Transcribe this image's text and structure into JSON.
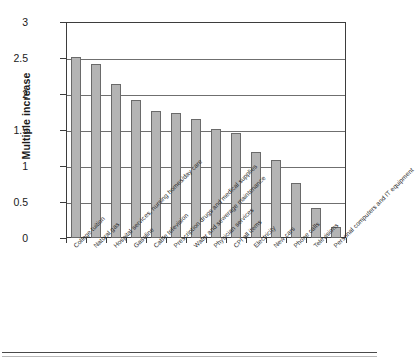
{
  "chart_data": {
    "type": "bar",
    "title": "",
    "subtitle": "",
    "xlabel": "",
    "ylabel": "Multiple increase",
    "ylim": [
      0,
      3
    ],
    "ytick_values": [
      0,
      0.5,
      1,
      1.5,
      2,
      2.5,
      3
    ],
    "ytick_labels": [
      "0",
      "0.5",
      "1",
      "1.5",
      "2",
      "2.5",
      "3"
    ],
    "grid": true,
    "legend": false,
    "orientation": "vertical",
    "bar_color": "#b4b4b4",
    "bar_edge_color": "#6a6a6a",
    "axis_color": "#3d3d3d",
    "categories": [
      "College tuition",
      "Natural gas",
      "Hospital services, nursing homes/day care",
      "Gasoline",
      "Cable television",
      "Prescription drugs and medical supplies",
      "Water and sewerage maintenance",
      "Physician services",
      "CPI all items",
      "Electricity",
      "New cars",
      "Phone calls",
      "Televisions",
      "Personal computers and IT equipment"
    ],
    "values": [
      2.51,
      2.41,
      2.14,
      1.91,
      1.77,
      1.74,
      1.65,
      1.51,
      1.46,
      1.19,
      1.09,
      0.76,
      0.41,
      0.15
    ]
  }
}
